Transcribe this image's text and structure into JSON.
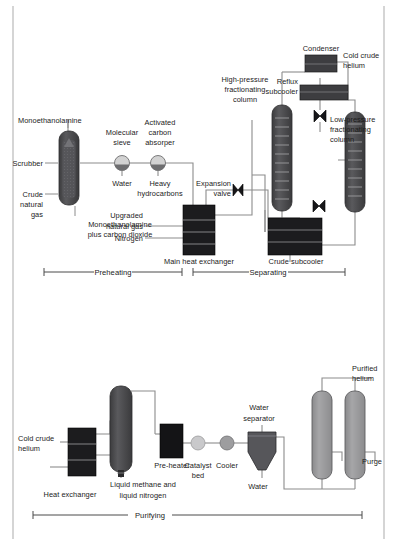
{
  "diagram": {
    "colors": {
      "vessel_dark": "#4f4f51",
      "vessel_darker": "#2f2f31",
      "block_black": "#1f1f21",
      "column_gray": "#9a9a9c",
      "circle_light": "#d2d2d2",
      "circle_mid": "#9d9d9f",
      "circle_dark": "#6e6e70",
      "pipe": "#8c8c8c",
      "text": "#1b1b1b",
      "frame": "#b9b9b9"
    },
    "stages": [
      {
        "id": "preheating",
        "label": "Preheating"
      },
      {
        "id": "separating",
        "label": "Separating"
      },
      {
        "id": "purifying",
        "label": "Purifying"
      }
    ],
    "top_section": {
      "labels": {
        "monoethanolamine": "Monoethanolamine",
        "scrubber": "Scrubber",
        "crude_natural_gas": "Crude\nnatural\ngas",
        "crude_natural_gas_l1": "Crude",
        "crude_natural_gas_l2": "natural",
        "crude_natural_gas_l3": "gas",
        "mea_plus_co2_l1": "Monoethanolamine",
        "mea_plus_co2_l2": "plus carbon dioxide",
        "molecular_sieve_l1": "Molecular",
        "molecular_sieve_l2": "sieve",
        "water": "Water",
        "activated_carbon_l1": "Activated",
        "activated_carbon_l2": "carbon",
        "activated_carbon_l3": "absorper",
        "heavy_hydrocarbons_l1": "Heavy",
        "heavy_hydrocarbons_l2": "hydrocarbons",
        "upgraded_natural_gas_l1": "Upgraded",
        "upgraded_natural_gas_l2": "natural gas",
        "nitrogen": "Nitrogen",
        "main_heat_exchanger": "Main heat exchanger",
        "expansion_valve_l1": "Expansion",
        "expansion_valve_l2": "valve",
        "high_pressure_column_l1": "High-pressure",
        "high_pressure_column_l2": "fractionating",
        "high_pressure_column_l3": "column",
        "condenser": "Condenser",
        "cold_crude_helium_l1": "Cold crude",
        "cold_crude_helium_l2": "helium",
        "reflux_subcooler_l1": "Reflux",
        "reflux_subcooler_l2": "subcooler",
        "low_pressure_column_l1": "Low-pressure",
        "low_pressure_column_l2": "fractionating",
        "low_pressure_column_l3": "column",
        "crude_subcooler": "Crude subcooler"
      }
    },
    "bottom_section": {
      "labels": {
        "cold_crude_helium_l1": "Cold crude",
        "cold_crude_helium_l2": "helium",
        "heat_exchanger": "Heat exchanger",
        "liquid_methane_l1": "Liquid methane and",
        "liquid_methane_l2": "liquid nitrogen",
        "pre_heater": "Pre-heater",
        "catalyst_bed_l1": "Catalyst",
        "catalyst_bed_l2": "bed",
        "cooler": "Cooler",
        "water_separator_l1": "Water",
        "water_separator_l2": "separator",
        "water": "Water",
        "purified_helium_l1": "Purified",
        "purified_helium_l2": "helium",
        "purge": "Purge"
      }
    }
  }
}
